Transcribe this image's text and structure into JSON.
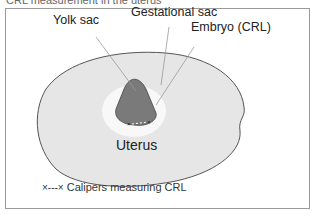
{
  "clipped_heading": "CRL measurement in the uterus",
  "diagram": {
    "labels": {
      "yolk_sac": "Yolk sac",
      "gestational_sac": "Gestational sac",
      "embryo": "Embryo (CRL)",
      "uterus": "Uterus"
    },
    "legend": {
      "symbol": "×---×",
      "text": "Calipers measuring CRL"
    },
    "colors": {
      "uterus_fill": "#e6e6e6",
      "sac_fill": "#f7f7f7",
      "embryo_fill": "#7a7a7a",
      "outline": "#555555"
    }
  }
}
